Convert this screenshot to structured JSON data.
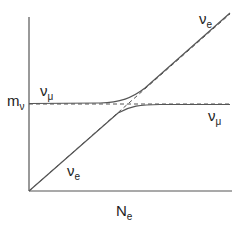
{
  "diagram": {
    "title": "",
    "colors": {
      "background": "#ffffff",
      "axis": "#555555",
      "curve": "#555555",
      "dashed": "#555555",
      "text": "#222222"
    },
    "axes": {
      "y_label": {
        "main": "m",
        "sub": "ν"
      },
      "x_label": {
        "main": "N",
        "sub": "e"
      }
    },
    "labels": {
      "nu_mu_left": {
        "main": "ν",
        "sub": "μ"
      },
      "nu_e_top_right": {
        "main": "ν",
        "sub": "e"
      },
      "nu_mu_right": {
        "main": "ν",
        "sub": "μ"
      },
      "nu_e_lower_left": {
        "main": "ν",
        "sub": "e"
      }
    },
    "curves": [
      {
        "name": "upper-eigenstate",
        "style": "solid",
        "description": "starts flat at m_ν (ν_μ), bends upward after crossing and follows the ν_e diagonal"
      },
      {
        "name": "lower-eigenstate",
        "style": "solid",
        "description": "starts on ν_e diagonal from origin, bends to flat at m_ν (ν_μ) after crossing"
      },
      {
        "name": "nu-e-unmixed",
        "style": "dashed",
        "description": "diagonal line from origin"
      },
      {
        "name": "nu-mu-unmixed",
        "style": "dashed",
        "description": "horizontal line at m_ν"
      }
    ]
  }
}
